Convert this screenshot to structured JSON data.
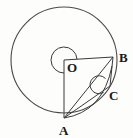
{
  "figure": {
    "background_color": "#fdfdfc",
    "stroke_color": "#3a3a3a",
    "label_color": "#1a1a1a"
  },
  "circle": {
    "name": "main-circle",
    "center_x": 64,
    "center_y": 60,
    "radius": 53,
    "stroke": "#4a4a4a",
    "stroke_width": 1.1,
    "fill": "none"
  },
  "points": [
    {
      "id": "O",
      "label": "O",
      "x": 64,
      "y": 60,
      "label_x": 67,
      "label_y": 72,
      "role": "centre"
    },
    {
      "id": "A",
      "label": "A",
      "x": 64,
      "y": 118,
      "label_x": 60,
      "label_y": 134,
      "role": "circumference"
    },
    {
      "id": "B",
      "label": "B",
      "x": 113,
      "y": 57,
      "label_x": 118,
      "label_y": 62,
      "role": "circumference"
    },
    {
      "id": "C",
      "label": "C",
      "x": 110,
      "y": 86,
      "label_x": 110,
      "label_y": 100,
      "role": "point-on-arc"
    }
  ],
  "segments": [
    {
      "id": "OB",
      "from": "O",
      "to": "B",
      "label": "radius O to B"
    },
    {
      "id": "OA",
      "from": "O",
      "to": "A",
      "label": "radius O to A"
    },
    {
      "id": "AB",
      "from": "A",
      "to": "B",
      "label": "chord A to B"
    },
    {
      "id": "AC",
      "from": "A",
      "to": "C",
      "label": "segment A to C"
    },
    {
      "id": "BC",
      "from": "B",
      "to": "C",
      "label": "segment B to C"
    }
  ],
  "arcs": [
    {
      "id": "reflex-angle-O",
      "vertex": "O",
      "type": "reflex",
      "description": "reflex angle AOB marked at centre O",
      "radius": 13
    },
    {
      "id": "angle-C",
      "vertex": "C",
      "type": "interior",
      "description": "angle marked at point C",
      "radius": 9
    },
    {
      "id": "arc-A-to-B",
      "type": "curve",
      "description": "curved arc from A bulging toward C and B"
    }
  ],
  "labels": {
    "O": "O",
    "A": "A",
    "B": "B",
    "C": "C"
  }
}
